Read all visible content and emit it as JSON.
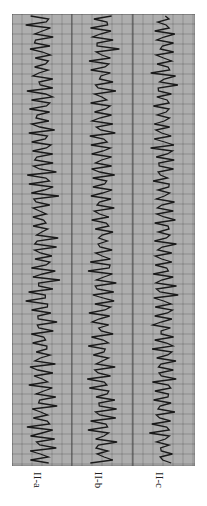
{
  "figure": {
    "strips": [
      {
        "id": "a",
        "label": "II-a",
        "x": 12,
        "width": 60,
        "amplitude": 14,
        "seed": 3
      },
      {
        "id": "b",
        "label": "II-b",
        "x": 72,
        "width": 61,
        "amplitude": 13,
        "seed": 7
      },
      {
        "id": "c",
        "label": "II-c",
        "x": 133,
        "width": 62,
        "amplitude": 12,
        "seed": 11
      }
    ],
    "colors": {
      "paper": "#bdbdbd",
      "grid_minor": "#8a8a8a",
      "grid_major": "#555555",
      "trace": "#1a1a1a",
      "label": "#222222"
    }
  }
}
